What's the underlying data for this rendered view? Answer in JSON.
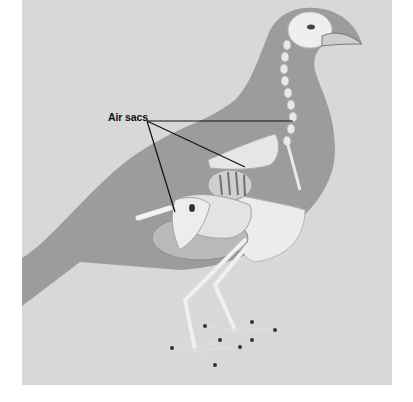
{
  "figure": {
    "label": {
      "text": "Air sacs"
    },
    "colors": {
      "page_background": "#ffffff",
      "panel": "#d8d8d8",
      "silhouette": "#9c9c9c",
      "bone": "#efefef",
      "bone_shade": "#bdbdbd",
      "leader_line": "#111111"
    },
    "leader_lines": [
      {
        "to": "neck/clavicular air sac",
        "x1": 147,
        "y1": 121,
        "x2": 293,
        "y2": 121
      },
      {
        "to": "thoracic air sac",
        "x1": 147,
        "y1": 121,
        "x2": 245,
        "y2": 167
      },
      {
        "to": "abdominal air sac",
        "x1": 147,
        "y1": 121,
        "x2": 175,
        "y2": 212
      }
    ]
  }
}
